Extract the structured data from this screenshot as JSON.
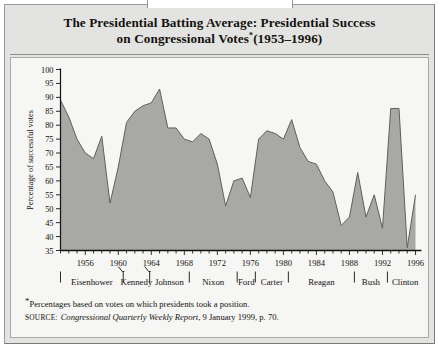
{
  "figure": {
    "title_line1": "The Presidential Batting Average: Presidential Success",
    "title_line2_pre": "on Congressional Votes",
    "title_asterisk": "*",
    "title_line2_post": "(1953–1996)"
  },
  "footnote": {
    "asterisk": "*",
    "note": "Percentages based on votes on which presidents took a position.",
    "source_label": "SOURCE:",
    "source_italic": "Congressional Quarterly Weekly Report",
    "source_rest": ", 9 January 1999, p. 70."
  },
  "colors": {
    "area_fill": "#a8a8a6",
    "area_stroke": "#5f5f5e",
    "axis": "#14120f",
    "panel_bg": "#e3e3e1",
    "plot_bg": "#f6f6f4",
    "border": "#a8a8a6"
  },
  "chart_data": {
    "type": "area",
    "xlabel": "",
    "ylabel": "Percentage of successful votes",
    "ylim": [
      35,
      100
    ],
    "xlim": [
      1953,
      1996
    ],
    "ytick_step": 5,
    "grid": false,
    "yticks": [
      35,
      40,
      45,
      50,
      55,
      60,
      65,
      70,
      75,
      80,
      85,
      90,
      95,
      100
    ],
    "xticks_labeled": [
      1956,
      1960,
      1964,
      1968,
      1972,
      1976,
      1980,
      1984,
      1988,
      1992,
      1996
    ],
    "x": [
      1953,
      1954,
      1955,
      1956,
      1957,
      1958,
      1959,
      1960,
      1961,
      1962,
      1963,
      1964,
      1965,
      1966,
      1967,
      1968,
      1969,
      1970,
      1971,
      1972,
      1973,
      1974,
      1975,
      1976,
      1977,
      1978,
      1979,
      1980,
      1981,
      1982,
      1983,
      1984,
      1985,
      1986,
      1987,
      1988,
      1989,
      1990,
      1991,
      1992,
      1993,
      1994,
      1995,
      1996
    ],
    "values": [
      89,
      83,
      75,
      70,
      68,
      76,
      52,
      65,
      81,
      85,
      87,
      88,
      93,
      79,
      79,
      75,
      74,
      77,
      75,
      66,
      51,
      60,
      61,
      54,
      75,
      78,
      77,
      75,
      82,
      72,
      67,
      66,
      60,
      56,
      44,
      47,
      63,
      47,
      55,
      43,
      86,
      86,
      36,
      55
    ],
    "annotations": [
      {
        "label": "peak 1965",
        "x": 1965,
        "y": 93
      },
      {
        "label": "trough 1959",
        "x": 1959,
        "y": 52
      },
      {
        "label": "spike 1993",
        "x": 1993,
        "y": 86
      },
      {
        "label": "low 1995",
        "x": 1995,
        "y": 36
      }
    ]
  },
  "presidents": [
    {
      "name": "Eisenhower",
      "start": 1953,
      "end": 1960.6
    },
    {
      "name": "Kennedy",
      "start": 1960.6,
      "end": 1963.8
    },
    {
      "name": "Johnson",
      "start": 1963.8,
      "end": 1968.6
    },
    {
      "name": "Nixon",
      "start": 1968.6,
      "end": 1974.4
    },
    {
      "name": "Ford",
      "start": 1974.4,
      "end": 1976.6
    },
    {
      "name": "Carter",
      "start": 1976.6,
      "end": 1980.6
    },
    {
      "name": "Reagan",
      "start": 1980.6,
      "end": 1988.6
    },
    {
      "name": "Bush",
      "start": 1988.6,
      "end": 1992.6
    },
    {
      "name": "Clinton",
      "start": 1992.6,
      "end": 1996.9
    }
  ]
}
